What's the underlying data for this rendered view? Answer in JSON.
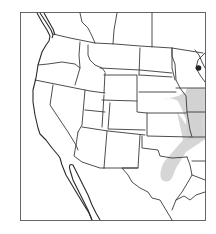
{
  "map": {
    "type": "outline map",
    "region": "Western and Central United States with northern Mexico",
    "features": {
      "state_borders": true,
      "frame": true,
      "labels": []
    },
    "highlight_band": {
      "description": "Shaded diagonal band from north-central Texas through Oklahoma and eastern Kansas into Missouri/Iowa",
      "color": "#c8c8c8"
    },
    "marker": {
      "description": "Dark dot in eastern Wisconsin",
      "color": "#222222"
    },
    "colors": {
      "background": "#ffffff",
      "lines": "#3a3a3a",
      "shading": "#c8c8c8"
    }
  }
}
